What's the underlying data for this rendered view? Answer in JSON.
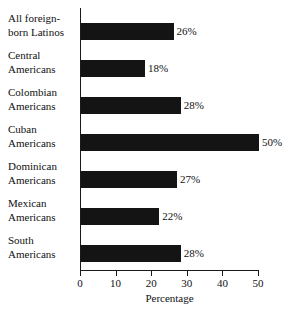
{
  "chart_data": {
    "type": "bar",
    "orientation": "horizontal",
    "title": "",
    "subtitle": "",
    "xlabel": "Percentage",
    "ylabel": "",
    "xlim": [
      0,
      50
    ],
    "xticks": [
      0,
      10,
      20,
      30,
      40,
      50
    ],
    "xtick_labels": [
      "0",
      "10",
      "20",
      "30",
      "40",
      "50"
    ],
    "grid": false,
    "legend": false,
    "bar_color": "#141414",
    "axis_color": "#1a1a1a",
    "background_color": "#ffffff",
    "categories": [
      "All foreign-born Latinos",
      "Central Americans",
      "Colombian Americans",
      "Cuban Americans",
      "Dominican Americans",
      "Mexican Americans",
      "South Americans"
    ],
    "values": [
      26,
      18,
      28,
      50,
      27,
      22,
      28
    ],
    "data_labels": [
      "26%",
      "18%",
      "28%",
      "50%",
      "27%",
      "22%",
      "28%"
    ],
    "bars": [
      {
        "label_line1": "All foreign-",
        "label_line2": "born Latinos",
        "value": 26,
        "data_label": "26%"
      },
      {
        "label_line1": "Central",
        "label_line2": "Americans",
        "value": 18,
        "data_label": "18%"
      },
      {
        "label_line1": "Colombian",
        "label_line2": "Americans",
        "value": 28,
        "data_label": "28%"
      },
      {
        "label_line1": "Cuban",
        "label_line2": "Americans",
        "value": 50,
        "data_label": "50%"
      },
      {
        "label_line1": "Dominican",
        "label_line2": "Americans",
        "value": 27,
        "data_label": "27%"
      },
      {
        "label_line1": "Mexican",
        "label_line2": "Americans",
        "value": 22,
        "data_label": "22%"
      },
      {
        "label_line1": "South",
        "label_line2": "Americans",
        "value": 28,
        "data_label": "28%"
      }
    ]
  }
}
